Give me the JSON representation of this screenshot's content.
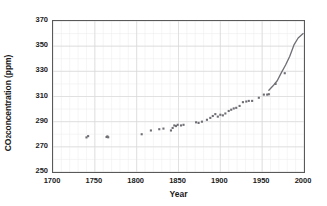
{
  "chart_data": {
    "type": "scatter",
    "title": "",
    "xlabel": "Year",
    "ylabel": "CO2 concentration (ppm)",
    "ylabel_parts": {
      "prefix": "CO",
      "subscript": "2",
      "suffix": " concentration (ppm)"
    },
    "xlim": [
      1700,
      2000
    ],
    "ylim": [
      250,
      370
    ],
    "xticks": [
      1700,
      1750,
      1800,
      1850,
      1900,
      1950,
      2000
    ],
    "yticks": [
      250,
      270,
      290,
      310,
      330,
      350,
      370
    ],
    "xtick_labels": [
      "1700",
      "1750",
      "1800",
      "1850",
      "1900",
      "1950",
      "2000"
    ],
    "ytick_labels": [
      "250",
      "270",
      "290",
      "310",
      "330",
      "350",
      "370"
    ],
    "x_minor_step": 10,
    "y_minor_step": 10,
    "grid": true,
    "grid_color": "#d9d9d9",
    "grid_minor_color": "#eeeeee",
    "legend": "none",
    "marker_color": "#6e6e75",
    "marker_shape": "square",
    "marker_size": 2.1,
    "line_color": "#6e6e75",
    "line_width": 1.3,
    "series": [
      {
        "name": "Ice core measurements",
        "type": "scatter",
        "points": [
          [
            1740,
            277.5
          ],
          [
            1742,
            278.5
          ],
          [
            1764,
            277.8
          ],
          [
            1765,
            278.3
          ],
          [
            1766,
            277.6
          ],
          [
            1806,
            280.0
          ],
          [
            1817,
            283.0
          ],
          [
            1827,
            284.0
          ],
          [
            1832,
            284.5
          ],
          [
            1841,
            283.0
          ],
          [
            1843,
            285.0
          ],
          [
            1845,
            287.0
          ],
          [
            1847,
            286.5
          ],
          [
            1849,
            287.5
          ],
          [
            1853,
            287.0
          ],
          [
            1856,
            287.5
          ],
          [
            1871,
            289.5
          ],
          [
            1874,
            289.0
          ],
          [
            1878,
            290.0
          ],
          [
            1884,
            291.5
          ],
          [
            1888,
            293.0
          ],
          [
            1891,
            294.5
          ],
          [
            1894,
            296.0
          ],
          [
            1897,
            294.0
          ],
          [
            1900,
            295.5
          ],
          [
            1903,
            295.0
          ],
          [
            1906,
            296.5
          ],
          [
            1910,
            298.5
          ],
          [
            1913,
            299.5
          ],
          [
            1916,
            300.5
          ],
          [
            1919,
            301.0
          ],
          [
            1923,
            302.5
          ],
          [
            1927,
            305.5
          ],
          [
            1931,
            306.0
          ],
          [
            1934,
            306.5
          ],
          [
            1938,
            306.5
          ],
          [
            1946,
            309.0
          ],
          [
            1952,
            311.5
          ],
          [
            1956,
            311.5
          ],
          [
            1958,
            311.8
          ]
        ]
      },
      {
        "name": "Mauna Loa record",
        "type": "line",
        "points": [
          [
            1958,
            315.0
          ],
          [
            1963,
            318.5
          ],
          [
            1968,
            322.5
          ],
          [
            1973,
            329.0
          ],
          [
            1978,
            335.0
          ],
          [
            1983,
            342.0
          ],
          [
            1988,
            351.0
          ],
          [
            1993,
            356.5
          ],
          [
            1999,
            360.0
          ]
        ]
      },
      {
        "name": "Overlap markers",
        "type": "scatter",
        "points": [
          [
            1966,
            320.0
          ],
          [
            1977,
            328.5
          ]
        ]
      }
    ]
  },
  "figure": {
    "background_color": "#ffffff",
    "frame_color": "#595959"
  }
}
